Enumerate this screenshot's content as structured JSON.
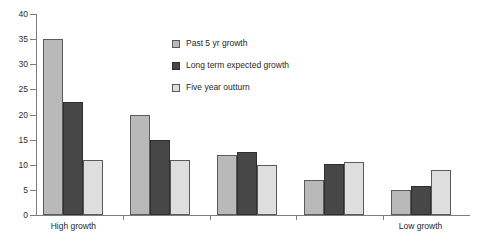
{
  "chart_data": {
    "type": "bar",
    "title": "",
    "xlabel": "",
    "ylabel": "",
    "ylim": [
      0,
      40
    ],
    "ytick_step": 5,
    "yticks": [
      "40",
      "35",
      "30",
      "25",
      "20",
      "15",
      "10",
      "5",
      "0"
    ],
    "grid": false,
    "legend_position": "upper-center",
    "categories": [
      "High growth",
      "",
      "",
      "",
      "Low growth"
    ],
    "category_count": 5,
    "series": [
      {
        "name": "Past 5 yr growth",
        "color": "#b9b9b9",
        "values": [
          35,
          20,
          12,
          7,
          5
        ]
      },
      {
        "name": "Long term expected growth",
        "color": "#474747",
        "values": [
          22.5,
          15,
          12.5,
          10.2,
          5.7
        ]
      },
      {
        "name": "Five year outturn",
        "color": "#dedede",
        "values": [
          11,
          11,
          10,
          10.5,
          9
        ]
      }
    ]
  },
  "axis": {
    "line_color": "#7d7d7d"
  },
  "legend": {
    "items": [
      {
        "label": "Past 5 yr growth"
      },
      {
        "label": "Long term expected growth"
      },
      {
        "label": "Five year outturn"
      }
    ]
  }
}
